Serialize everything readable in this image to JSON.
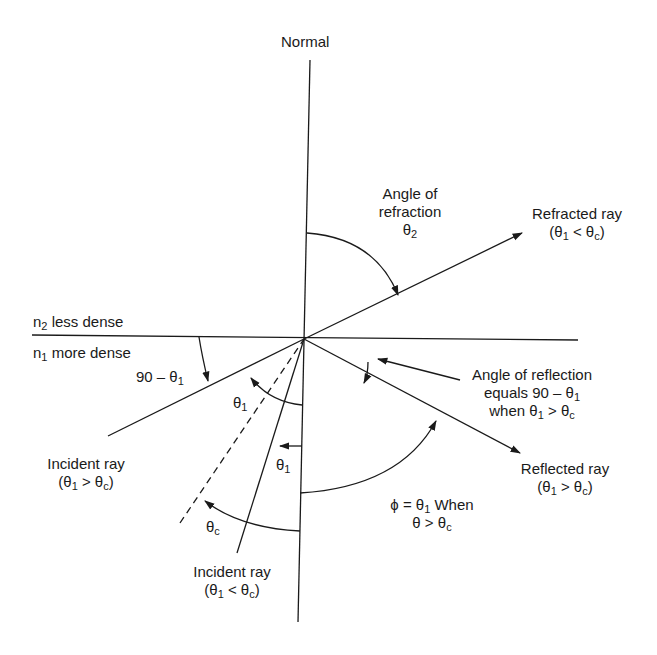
{
  "diagram": {
    "title": "Normal",
    "media": {
      "upper": {
        "n": "n",
        "sub": "2",
        "text": " less dense"
      },
      "lower": {
        "n": "n",
        "sub": "1",
        "text": " more dense"
      }
    },
    "labels": {
      "angle_refraction": {
        "line1": "Angle of",
        "line2": "refraction",
        "symbol": "θ",
        "sub": "2"
      },
      "refracted_ray": {
        "line1": "Refracted ray",
        "cond": "(θ",
        "sub1": "1",
        "mid": " < θ",
        "sub2": "c",
        "end": ")"
      },
      "ninety_minus": {
        "text": "90 – θ",
        "sub": "1"
      },
      "theta1_upper": {
        "symbol": "θ",
        "sub": "1"
      },
      "theta1_lower": {
        "symbol": "θ",
        "sub": "1"
      },
      "theta_c": {
        "symbol": "θ",
        "sub": "c"
      },
      "angle_reflection": {
        "line1": "Angle of reflection",
        "line2": "equals 90 – θ",
        "line2_sub": "1",
        "line3a": "when θ",
        "line3_sub1": "1",
        "line3b": " > θ",
        "line3_sub2": "c"
      },
      "reflected_ray": {
        "line1": "Reflected ray",
        "cond": "(θ",
        "sub1": "1",
        "mid": " > θ",
        "sub2": "c",
        "end": ")"
      },
      "incident_ray_tir": {
        "line1": "Incident ray",
        "cond": "(θ",
        "sub1": "1",
        "mid": " > θ",
        "sub2": "c",
        "end": ")"
      },
      "incident_ray_refr": {
        "line1": "Incident ray",
        "cond": "(θ",
        "sub1": "1",
        "mid": " < θ",
        "sub2": "c",
        "end": ")"
      },
      "phi": {
        "line1a": "ϕ = θ",
        "line1_sub": "1",
        "line1b": " When",
        "line2a": "θ > θ",
        "line2_sub": "c"
      }
    },
    "colors": {
      "ink": "#1a1a1a",
      "background": "#ffffff"
    }
  }
}
